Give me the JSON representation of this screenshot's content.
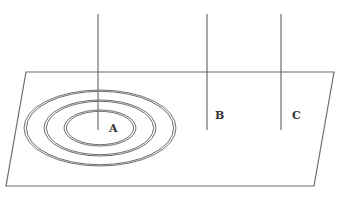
{
  "diagram": {
    "colors": {
      "stroke": "#6e6e6e",
      "label": "#333333",
      "background": "#ffffff"
    },
    "plane": {
      "points": [
        [
          26,
          72
        ],
        [
          334,
          72
        ],
        [
          314,
          186
        ],
        [
          6,
          186
        ]
      ]
    },
    "lines": [
      {
        "id": "A",
        "x": 98,
        "y1": 14,
        "y2": 130,
        "label": "A",
        "label_x": 109,
        "label_y": 132
      },
      {
        "id": "B",
        "x": 207,
        "y1": 14,
        "y2": 130,
        "label": "B",
        "label_x": 215,
        "label_y": 119
      },
      {
        "id": "C",
        "x": 281,
        "y1": 14,
        "y2": 130,
        "label": "C",
        "label_x": 292,
        "label_y": 119
      }
    ],
    "rings": {
      "center": [
        100,
        128
      ],
      "ellipses": [
        {
          "rx": 76,
          "ry": 38
        },
        {
          "rx": 56,
          "ry": 28
        },
        {
          "rx": 36,
          "ry": 18
        }
      ]
    }
  }
}
